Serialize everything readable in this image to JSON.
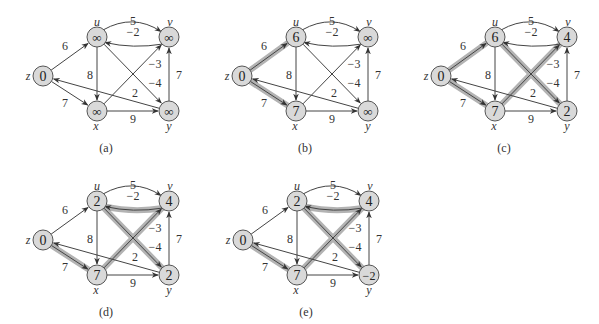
{
  "figure": {
    "colors": {
      "node_fill": "#d9d9d9",
      "node_stroke": "#555555",
      "edge": "#444444",
      "shade": "#b3b3b3",
      "text": "#333333"
    },
    "vertices": [
      "z",
      "u",
      "v",
      "x",
      "y"
    ],
    "edges": [
      {
        "id": "zu",
        "from": "z",
        "to": "u",
        "weight": "6"
      },
      {
        "id": "zx",
        "from": "z",
        "to": "x",
        "weight": "7"
      },
      {
        "id": "uv",
        "from": "u",
        "to": "v",
        "weight": "5"
      },
      {
        "id": "vu",
        "from": "v",
        "to": "u",
        "weight": "−2"
      },
      {
        "id": "ux",
        "from": "u",
        "to": "x",
        "weight": "8"
      },
      {
        "id": "xv",
        "from": "x",
        "to": "v",
        "weight": "−3"
      },
      {
        "id": "uy",
        "from": "u",
        "to": "y",
        "weight": "−4"
      },
      {
        "id": "yv",
        "from": "y",
        "to": "v",
        "weight": "7"
      },
      {
        "id": "yz",
        "from": "y",
        "to": "z",
        "weight": "2"
      },
      {
        "id": "xy",
        "from": "x",
        "to": "y",
        "weight": "9"
      }
    ],
    "panels": [
      {
        "caption": "(a)",
        "d": {
          "z": "0",
          "u": "∞",
          "v": "∞",
          "x": "∞",
          "y": "∞"
        },
        "shaded": []
      },
      {
        "caption": "(b)",
        "d": {
          "z": "0",
          "u": "6",
          "v": "∞",
          "x": "7",
          "y": "∞"
        },
        "shaded": [
          "zu",
          "zx"
        ]
      },
      {
        "caption": "(c)",
        "d": {
          "z": "0",
          "u": "6",
          "v": "4",
          "x": "7",
          "y": "2"
        },
        "shaded": [
          "zu",
          "zx",
          "xv",
          "uy"
        ]
      },
      {
        "caption": "(d)",
        "d": {
          "z": "0",
          "u": "2",
          "v": "4",
          "x": "7",
          "y": "2"
        },
        "shaded": [
          "zx",
          "vu",
          "xv",
          "uy"
        ]
      },
      {
        "caption": "(e)",
        "d": {
          "z": "0",
          "u": "2",
          "v": "4",
          "x": "7",
          "y": "−2"
        },
        "shaded": [
          "zx",
          "vu",
          "xv",
          "uy"
        ]
      }
    ]
  }
}
